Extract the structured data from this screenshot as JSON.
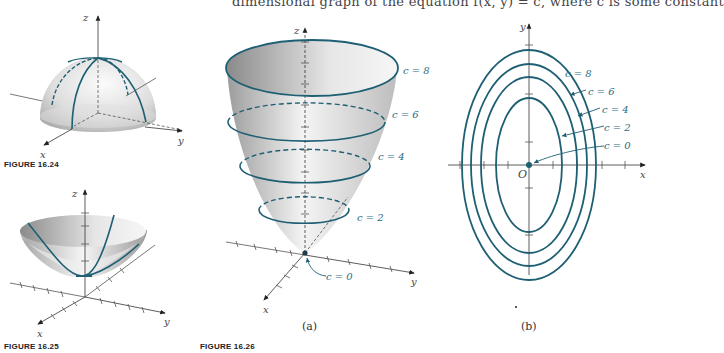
{
  "page": {
    "top_text": "dimensional graph of the equation f(x, y) = c, where c is some constant"
  },
  "figures": [
    {
      "id": "fig-16-24",
      "caption": "FIGURE 16.24",
      "surface": "hemisphere",
      "axes": {
        "x": "x",
        "y": "y",
        "z": "z"
      }
    },
    {
      "id": "fig-16-25",
      "caption": "FIGURE 16.25",
      "surface": "paraboloid",
      "axes": {
        "x": "x",
        "y": "y",
        "z": "z"
      }
    },
    {
      "id": "fig-16-26",
      "caption": "FIGURE 16.26",
      "panels": [
        {
          "label": "(a)",
          "axes": {
            "x": "x",
            "y": "y",
            "z": "z"
          },
          "levels": [
            "c = 8",
            "c = 6",
            "c = 4",
            "c = 2",
            "c = 0"
          ]
        },
        {
          "label": "(b)",
          "axes": {
            "x": "x",
            "y": "y"
          },
          "origin": "O",
          "levels": [
            "c = 8",
            "c = 6",
            "c = 4",
            "c = 2",
            "c = 0"
          ]
        }
      ]
    }
  ],
  "colors": {
    "curve": "#1f5f73",
    "label": "#2a6a80",
    "axis": "#333333",
    "surface_light": "#f2f2f2",
    "surface_dark": "#9a9a9a"
  }
}
